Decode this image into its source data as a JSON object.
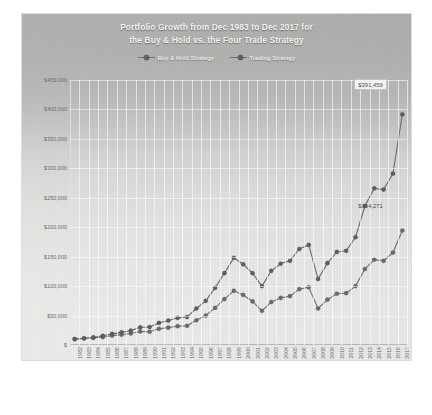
{
  "title": {
    "line1": "Portfolio Growth from Dec 1983 to Dec 2017 for",
    "line2": "the Buy & Hold vs. the Four Trade Strategy"
  },
  "legend": {
    "position": "top-center",
    "items": [
      {
        "label": "Buy & Hold Strategy",
        "icon": "line-marker-icon",
        "color": "#6a6a6a"
      },
      {
        "label": "Trading Strategy",
        "icon": "line-marker-icon",
        "color": "#5d5d5d"
      }
    ]
  },
  "callouts": [
    {
      "name": "trading-final-value",
      "text": "$391,459"
    },
    {
      "name": "buyhold-final-value",
      "text": "$194,271"
    }
  ],
  "colors": {
    "buy_hold": "#6a6a6a",
    "trading": "#5d5d5d",
    "plot_background_top": "#a8a8a6",
    "plot_background_bottom": "#f2f2f0",
    "gridline": "#ffffff",
    "axis_text": "#6d6d6b",
    "title_text": "#f4f4f2"
  },
  "chart_data": {
    "type": "line",
    "title": "Portfolio Growth from Dec 1983 to Dec 2017 for the Buy & Hold vs. the Four Trade Strategy",
    "xlabel": "",
    "ylabel": "",
    "grid": true,
    "ylim": [
      0,
      450000
    ],
    "ytick_labels": [
      "$450,000",
      "$400,000",
      "$350,000",
      "$300,000",
      "$250,000",
      "$200,000",
      "$150,000",
      "$100,000",
      "$50,000",
      "$"
    ],
    "ytick_values": [
      450000,
      400000,
      350000,
      300000,
      250000,
      200000,
      150000,
      100000,
      50000,
      0
    ],
    "categories": [
      "1982",
      "1983",
      "1984",
      "1985",
      "1986",
      "1987",
      "1988",
      "1989",
      "1990",
      "1991",
      "1992",
      "1993",
      "1994",
      "1995",
      "1996",
      "1997",
      "1998",
      "1999",
      "2000",
      "2001",
      "2002",
      "2003",
      "2004",
      "2005",
      "2006",
      "2007",
      "2008",
      "2009",
      "2010",
      "2011",
      "2012",
      "2013",
      "2014",
      "2015",
      "2016",
      "2017"
    ],
    "series": [
      {
        "name": "Trading Strategy",
        "color": "#5d5d5d",
        "marker": "circle",
        "final_label": "$391,459",
        "values": [
          10000,
          11500,
          13000,
          15500,
          19000,
          21500,
          24500,
          30000,
          30500,
          37500,
          41500,
          46000,
          47500,
          62000,
          75000,
          97000,
          122000,
          148000,
          137000,
          122000,
          100000,
          126000,
          138000,
          143000,
          163000,
          170000,
          112000,
          139000,
          158000,
          160000,
          183000,
          236000,
          266000,
          264000,
          291000,
          391459
        ]
      },
      {
        "name": "Buy & Hold Strategy",
        "color": "#6a6a6a",
        "marker": "circle",
        "final_label": "$194,271",
        "values": [
          10000,
          11000,
          12000,
          13500,
          16000,
          17500,
          19500,
          23000,
          22500,
          27500,
          29500,
          32000,
          32500,
          42000,
          50000,
          63000,
          78000,
          92000,
          85000,
          74000,
          58000,
          73000,
          80000,
          83000,
          95000,
          98000,
          62000,
          77000,
          87000,
          88000,
          100000,
          129000,
          145000,
          143000,
          157000,
          194271
        ]
      }
    ]
  }
}
